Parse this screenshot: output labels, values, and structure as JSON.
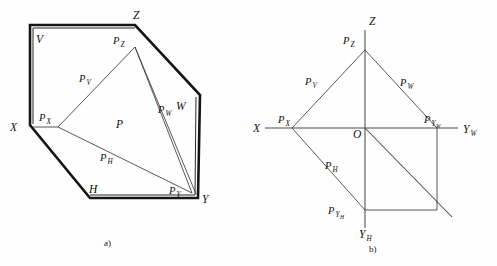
{
  "figure": {
    "captions": {
      "left": "a)",
      "right": "b)"
    },
    "colors": {
      "ink": "#101010",
      "thick_stroke": "#151515",
      "thin_stroke": "#262626",
      "axis_stroke": "#4a4a4a",
      "background": "#fefefe"
    },
    "panel_a": {
      "name": "pictorial-trihedral-view",
      "plane_labels": [
        {
          "id": "V",
          "text": "V",
          "x": 36,
          "y": 43
        },
        {
          "id": "W",
          "text": "W",
          "x": 176,
          "y": 110
        },
        {
          "id": "H",
          "text": "H",
          "x": 89,
          "y": 193
        },
        {
          "id": "P",
          "text": "P",
          "x": 116,
          "y": 128
        }
      ],
      "axis_labels": [
        {
          "id": "X",
          "text": "X",
          "x": 10,
          "y": 131
        },
        {
          "id": "Y",
          "text": "Y",
          "x": 202,
          "y": 203
        },
        {
          "id": "Z",
          "text": "Z",
          "x": 133,
          "y": 19
        }
      ],
      "trace_labels": [
        {
          "id": "Pv",
          "base": "P",
          "sub": "V",
          "x": 79,
          "y": 82
        },
        {
          "id": "Pw",
          "base": "P",
          "sub": "W",
          "x": 158,
          "y": 113
        },
        {
          "id": "Ph",
          "base": "P",
          "sub": "H",
          "x": 100,
          "y": 161
        }
      ],
      "point_labels": [
        {
          "id": "Pz",
          "base": "P",
          "sub": "Z",
          "x": 113,
          "y": 44
        },
        {
          "id": "Px",
          "base": "P",
          "sub": "X",
          "x": 39,
          "y": 121
        },
        {
          "id": "Py",
          "base": "P",
          "sub": "Y",
          "x": 169,
          "y": 194
        }
      ]
    },
    "panel_b": {
      "name": "orthographic-trace-view",
      "axis_labels": [
        {
          "id": "X",
          "text": "X",
          "x": 253,
          "y": 132
        },
        {
          "id": "Z",
          "text": "Z",
          "x": 369,
          "y": 25
        },
        {
          "id": "Yw",
          "base": "Y",
          "sub": "W",
          "x": 463,
          "y": 133
        },
        {
          "id": "Yh",
          "base": "Y",
          "sub": "H",
          "x": 359,
          "y": 238
        },
        {
          "id": "O",
          "text": "O",
          "x": 353,
          "y": 138
        }
      ],
      "trace_labels": [
        {
          "id": "Pv",
          "base": "P",
          "sub": "V",
          "x": 305,
          "y": 85
        },
        {
          "id": "Pw",
          "base": "P",
          "sub": "W",
          "x": 400,
          "y": 86
        },
        {
          "id": "Ph",
          "base": "P",
          "sub": "H",
          "x": 325,
          "y": 169
        }
      ],
      "point_labels": [
        {
          "id": "Pz",
          "base": "P",
          "sub": "Z",
          "x": 343,
          "y": 44
        },
        {
          "id": "Px",
          "base": "P",
          "sub": "X",
          "x": 278,
          "y": 123
        },
        {
          "id": "Pyw",
          "base": "P",
          "sub": "YW",
          "x": 424,
          "y": 123
        },
        {
          "id": "Pyh",
          "base": "P",
          "sub": "YH",
          "x": 328,
          "y": 214
        }
      ]
    }
  }
}
